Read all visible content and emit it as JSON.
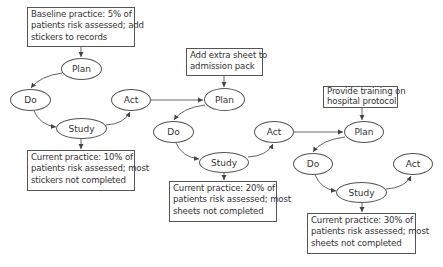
{
  "cycles": [
    {
      "input_box": {
        "lines": [
          "Baseline practice: 5% of",
          "patients risk assessed; add",
          "stickers to records"
        ]
      },
      "nodes": {
        "plan": "Plan",
        "do": "Do",
        "study": "Study",
        "act": "Act"
      },
      "outcome_box": {
        "lines": [
          "Current practice: 10% of",
          "patients risk assessed; most",
          "stickers not completed"
        ]
      }
    },
    {
      "input_box": {
        "lines": [
          "Add extra sheet to",
          "admission pack"
        ]
      },
      "nodes": {
        "plan": "Plan",
        "do": "Do",
        "study": "Study",
        "act": "Act"
      },
      "outcome_box": {
        "lines": [
          "Current practice: 20% of",
          "patients risk assessed; most",
          "sheets not completed"
        ]
      }
    },
    {
      "input_box": {
        "lines": [
          "Provide training on",
          "hospital protocol"
        ]
      },
      "nodes": {
        "plan": "Plan",
        "do": "Do",
        "study": "Study",
        "act": "Act"
      },
      "outcome_box": {
        "lines": [
          "Current practice: 30% of",
          "patients risk assessed; most",
          "sheets not completed"
        ]
      }
    }
  ],
  "colors": {
    "line": "#555555",
    "text": "#333333",
    "background": "#ffffff"
  }
}
